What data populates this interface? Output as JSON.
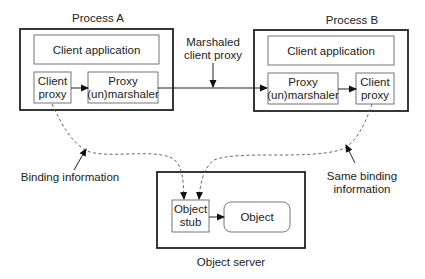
{
  "process_a": {
    "title": "Process A",
    "client_application": "Client application",
    "client_proxy": [
      "Client",
      "proxy"
    ],
    "marshaler": [
      "Proxy",
      "(un)marshaler"
    ]
  },
  "process_b": {
    "title": "Process B",
    "client_application": "Client application",
    "marshaler": [
      "Proxy",
      "(un)marshaler"
    ],
    "client_proxy": [
      "Client",
      "proxy"
    ]
  },
  "transfer_label": [
    "Marshaled",
    "client proxy"
  ],
  "object_server": {
    "title": "Object server",
    "stub": [
      "Object",
      "stub"
    ],
    "object": "Object"
  },
  "annotations": {
    "binding_info": "Binding information",
    "same_binding_info": [
      "Same binding",
      "information"
    ]
  }
}
